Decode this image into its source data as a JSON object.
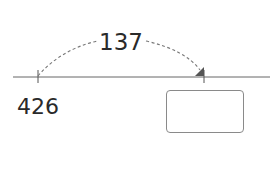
{
  "diagram": {
    "type": "number-line-jump",
    "start_label": "426",
    "jump_label": "137",
    "answer_box_value": "",
    "colors": {
      "line": "#555555",
      "text": "#2a2a2a",
      "arrow": "#555555",
      "box_border": "#8a8a8a"
    }
  }
}
